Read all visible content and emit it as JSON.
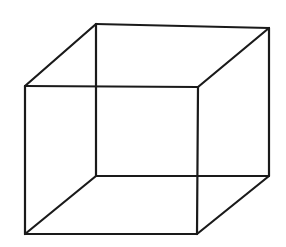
{
  "figure": {
    "name": "necker-cube",
    "background_color": "#ffffff",
    "stroke_color": "#1a1a1a",
    "stroke_width": 2.2,
    "canvas": {
      "width": 286,
      "height": 247
    },
    "text_labels": [],
    "vertices": {
      "front_top_left": {
        "x": 25,
        "y": 86
      },
      "front_top_right": {
        "x": 198,
        "y": 87
      },
      "front_bottom_right": {
        "x": 197,
        "y": 234
      },
      "front_bottom_left": {
        "x": 25,
        "y": 234
      },
      "back_top_left": {
        "x": 96,
        "y": 24
      },
      "back_top_right": {
        "x": 269,
        "y": 28
      },
      "back_bottom_right": {
        "x": 269,
        "y": 176
      },
      "back_bottom_left": {
        "x": 96,
        "y": 176
      }
    },
    "edges": [
      {
        "id": "front-top",
        "name": "front-face-top-edge",
        "points": "25,86 198,87"
      },
      {
        "id": "front-right",
        "name": "front-face-right-edge",
        "points": "198,87 197,234"
      },
      {
        "id": "front-bottom",
        "name": "front-face-bottom-edge",
        "points": "197,234 25,234"
      },
      {
        "id": "front-left",
        "name": "front-face-left-edge",
        "points": "25,234 25,86"
      },
      {
        "id": "back-top",
        "name": "back-face-top-edge",
        "points": "96,24 269,28"
      },
      {
        "id": "back-right",
        "name": "back-face-right-edge",
        "points": "269,28 269,176"
      },
      {
        "id": "back-bottom",
        "name": "back-face-bottom-edge",
        "points": "269,176 96,176"
      },
      {
        "id": "back-left",
        "name": "back-face-left-edge",
        "points": "96,176 96,24"
      },
      {
        "id": "connect-tl",
        "name": "connecting-edge-top-left",
        "points": "25,86 96,24"
      },
      {
        "id": "connect-tr",
        "name": "connecting-edge-top-right",
        "points": "198,87 269,28"
      },
      {
        "id": "connect-br",
        "name": "connecting-edge-bottom-right",
        "points": "197,234 269,176"
      },
      {
        "id": "connect-bl",
        "name": "connecting-edge-bottom-left",
        "points": "25,234 96,176"
      }
    ]
  }
}
